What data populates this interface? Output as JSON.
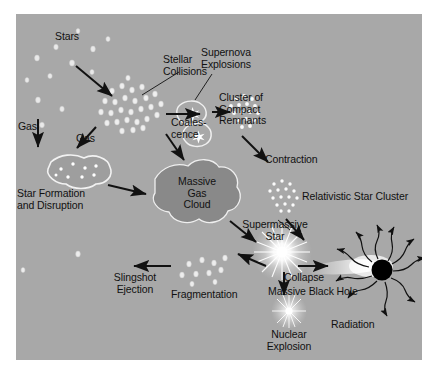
{
  "figure": {
    "kind": "astrophysics-flow-diagram",
    "background_color": "#ffffff",
    "panel_color": "#a8a8a8",
    "ink_color": "#111111",
    "highlight_color": "#f2f2f2",
    "cloud_color": "#8a8a8a",
    "black_hole_color": "#000000"
  },
  "labels": {
    "stars": "Stars",
    "stellar_collisions": "Stellar\nCollisions",
    "supernova_explosions": "Supernova\nExplosions",
    "coalescence": "Coales-\ncence",
    "cluster_of_compact_remnants": "Cluster of\nCompact\nRemnants",
    "contraction": "Contraction",
    "relativistic_star_cluster": "Relativistic Star Cluster",
    "gas_left": "Gas",
    "gas_right": "Gas",
    "star_formation_and_disruption": "Star Formation\nand Disruption",
    "massive_gas_cloud": "Massive\nGas\nCloud",
    "supermassive_star": "Supermassive\nStar",
    "slingshot_ejection": "Slingshot\nEjection",
    "fragmentation": "Fragmentation",
    "collapse": "Collapse",
    "nuclear_explosion": "Nuclear\nExplosion",
    "massive_black_hole": "Massive Black Hole",
    "radiation": "Radiation"
  },
  "nodes": [
    {
      "id": "stars",
      "label": "Stars",
      "type": "scattered-points"
    },
    {
      "id": "dense-cluster",
      "label": "Stellar Collisions",
      "type": "dense-point-cluster"
    },
    {
      "id": "supernova-blobs",
      "label": "Supernova Explosions",
      "type": "outlined-blobs-with-stars"
    },
    {
      "id": "compact-remnants",
      "label": "Cluster of Compact Remnants",
      "type": "bright-point-cluster"
    },
    {
      "id": "relativistic-cluster",
      "label": "Relativistic Star Cluster",
      "type": "bright-point-cluster"
    },
    {
      "id": "star-formation-blob",
      "label": "Star Formation and Disruption",
      "type": "outlined-blob-with-points"
    },
    {
      "id": "gas-cloud",
      "label": "Massive Gas Cloud",
      "type": "filled-blob"
    },
    {
      "id": "supermassive-star",
      "label": "Supermassive Star",
      "type": "starburst"
    },
    {
      "id": "fragment-cluster",
      "label": "Fragmentation",
      "type": "scattered-points"
    },
    {
      "id": "nuclear-explosion",
      "label": "Nuclear Explosion",
      "type": "small-starburst"
    },
    {
      "id": "black-hole",
      "label": "Massive Black Hole",
      "type": "black-disc-with-accretion"
    }
  ],
  "edges": [
    {
      "from": "stars",
      "to": "dense-cluster",
      "label": ""
    },
    {
      "from": "dense-cluster",
      "to": "supernova-blobs",
      "label": "Coales-cence"
    },
    {
      "from": "supernova-blobs",
      "to": "compact-remnants",
      "label": ""
    },
    {
      "from": "compact-remnants",
      "to": "relativistic-cluster",
      "label": "Contraction"
    },
    {
      "from": "stars",
      "to": "star-formation-blob",
      "label": "Gas"
    },
    {
      "from": "dense-cluster",
      "to": "star-formation-blob",
      "label": "Gas"
    },
    {
      "from": "star-formation-blob",
      "to": "gas-cloud",
      "label": ""
    },
    {
      "from": "dense-cluster",
      "to": "gas-cloud",
      "label": ""
    },
    {
      "from": "relativistic-cluster",
      "to": "supermassive-star",
      "label": ""
    },
    {
      "from": "gas-cloud",
      "to": "supermassive-star",
      "label": ""
    },
    {
      "from": "supermassive-star",
      "to": "fragment-cluster",
      "label": ""
    },
    {
      "from": "supermassive-star",
      "to": "black-hole",
      "label": "Collapse"
    },
    {
      "from": "supermassive-star",
      "to": "nuclear-explosion",
      "label": ""
    },
    {
      "from": "fragment-cluster",
      "to": "slingshot",
      "label": "Slingshot Ejection"
    },
    {
      "from": "black-hole",
      "to": "radiation",
      "label": "Radiation"
    }
  ]
}
